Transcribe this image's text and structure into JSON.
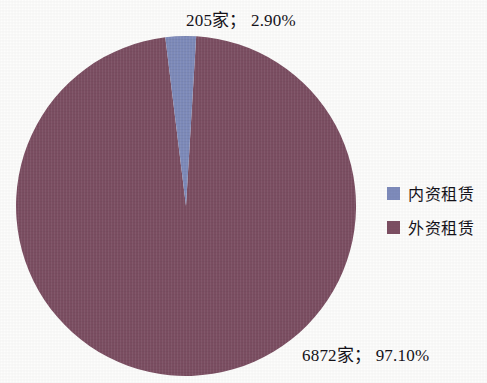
{
  "chart_data": {
    "type": "pie",
    "title": "",
    "subtitle": "",
    "xlabel": "",
    "ylabel": "",
    "grid": false,
    "legend_position": "right",
    "categories": [
      "内资租赁",
      "外资租赁"
    ],
    "values": [
      205,
      6872
    ],
    "percents": [
      2.9,
      97.1
    ],
    "unit_suffix": "家",
    "colors": [
      "#7f8cbc",
      "#7d4f63"
    ],
    "slices": [
      {
        "name": "内资租赁",
        "count": 205,
        "percent": 2.9,
        "color": "#7f8cbc",
        "label": "205家； 2.90%"
      },
      {
        "name": "外资租赁",
        "count": 6872,
        "percent": 97.1,
        "color": "#7d4f63",
        "label": "6872家； 97.10%"
      }
    ],
    "start_angle_deg": -7.0,
    "total": 7077
  },
  "labels": {
    "small_slice": "205家； 2.90%",
    "large_slice": "6872家； 97.10%"
  },
  "legend": {
    "items": [
      {
        "label": "内资租赁",
        "color": "#7f8cbc"
      },
      {
        "label": "外资租赁",
        "color": "#7d4f63"
      }
    ]
  },
  "canvas": {
    "background": "#fdfdfc",
    "width": 487,
    "height": 383
  }
}
